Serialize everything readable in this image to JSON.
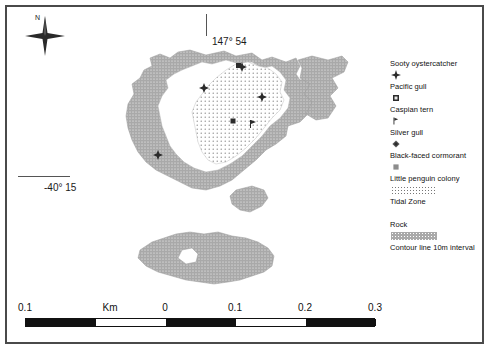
{
  "map": {
    "title": "",
    "coordinates": {
      "longitude_label": "147° 54",
      "latitude_label": "-40° 15"
    },
    "north_arrow": {
      "label": "N",
      "icon": "compass-north-star-icon"
    },
    "colors": {
      "rock_fill": "#a9a9a9",
      "tidal_fill": "#ffffff",
      "penguin_dot": "#777777",
      "marker": "#2b2b2b",
      "frame": "#4a4a4a",
      "text": "#111111"
    }
  },
  "legend": {
    "items": [
      {
        "label": "Sooty oystercatcher",
        "symbol": "cross-star-marker-icon"
      },
      {
        "label": "Pacific gull",
        "symbol": "filled-square-marker-icon"
      },
      {
        "label": "Caspian tern",
        "symbol": "flag-marker-icon"
      },
      {
        "label": "Silver gull",
        "symbol": "diamond-marker-icon"
      },
      {
        "label": "Black-faced cormorant",
        "symbol": "gray-square-marker-icon"
      },
      {
        "label": "Little penguin colony",
        "symbol": "dotted-area-swatch"
      },
      {
        "label": "Tidal Zone",
        "symbol": "white-area-swatch"
      },
      {
        "label": "Rock",
        "symbol": "gray-stipple-area-swatch"
      },
      {
        "label": "Contour line 10m interval",
        "symbol": "contour-line-swatch"
      }
    ]
  },
  "scalebar": {
    "unit": "Km",
    "unit_x": 85,
    "ticks": [
      {
        "label": "0.1",
        "x": 0
      },
      {
        "label": "0",
        "x": 140
      },
      {
        "label": "0.1",
        "x": 210
      },
      {
        "label": "0.2",
        "x": 280
      },
      {
        "label": "0.3",
        "x": 350
      }
    ],
    "segments": [
      {
        "x": 0,
        "w": 70
      },
      {
        "x": 140,
        "w": 70
      },
      {
        "x": 280,
        "w": 70
      }
    ]
  },
  "features": {
    "rock_outer_main": "M 206,55 L 224,51 L 236,56 L 252,53 L 262,60 L 272,57 L 286,62 L 296,58 L 300,66 L 296,74 L 300,80 L 310,78 L 318,84 L 316,94 L 322,100 L 318,110 L 308,114 L 300,122 L 288,126 L 286,136 L 276,144 L 266,150 L 256,160 L 244,170 L 232,180 L 220,186 L 206,190 L 192,188 L 180,182 L 168,176 L 156,170 L 146,162 L 138,152 L 132,140 L 128,128 L 126,116 L 128,104 L 134,94 L 132,84 L 140,78 L 144,70 L 152,66 L 150,58 L 160,54 L 170,58 L 178,52 L 190,50 Z",
    "tidal_inner_main": "M 212,64 L 226,60 L 240,64 L 252,62 L 262,68 L 272,66 L 280,72 L 286,80 L 284,90 L 290,98 L 288,108 L 280,118 L 270,126 L 262,136 L 252,146 L 242,156 L 230,164 L 218,170 L 206,172 L 194,168 L 184,162 L 176,154 L 170,146 L 166,136 L 162,126 L 160,116 L 158,106 L 162,96 L 168,88 L 166,80 L 174,74 L 182,70 L 192,66 L 202,62 Z",
    "penguin_colony": "M 236,64 L 248,62 L 258,66 L 268,68 L 276,74 L 282,82 L 280,92 L 284,100 L 280,110 L 272,118 L 264,128 L 256,138 L 246,148 L 236,156 L 226,162 L 216,164 L 208,160 L 202,152 L 198,142 L 196,132 L 194,122 L 192,112 L 196,102 L 202,94 L 208,86 L 216,78 L 226,70 Z",
    "rock_lobe_east": "M 300,62 L 312,58 L 326,62 L 338,58 L 344,64 L 340,74 L 330,80 L 334,88 L 328,96 L 332,106 L 326,116 L 316,118 L 308,112 L 312,102 L 306,94 L 310,84 L 302,78 L 304,70 Z",
    "rock_small_island": "M 236,190 L 252,186 L 264,190 L 268,198 L 262,206 L 250,212 L 240,210 L 232,204 L 230,196 Z",
    "rock_south_island": "M 140,250 L 152,242 L 164,238 L 176,234 L 190,232 L 204,234 L 218,232 L 232,236 L 246,238 L 258,242 L 268,248 L 274,256 L 272,266 L 264,272 L 252,276 L 240,280 L 228,282 L 214,284 L 200,282 L 186,280 L 172,276 L 158,272 L 146,266 L 138,258 Z",
    "lagoon_hole": "M 182,250 L 192,248 L 198,254 L 196,262 L 186,264 L 178,258 Z",
    "markers": [
      {
        "type": "cross-star-marker-icon",
        "species": "Sooty oystercatcher",
        "x": 242,
        "y": 67
      },
      {
        "type": "cross-star-marker-icon",
        "species": "Sooty oystercatcher",
        "x": 204,
        "y": 88
      },
      {
        "type": "cross-star-marker-icon",
        "species": "Sooty oystercatcher",
        "x": 262,
        "y": 97
      },
      {
        "type": "cross-star-marker-icon",
        "species": "Sooty oystercatcher",
        "x": 158,
        "y": 155
      },
      {
        "type": "filled-square-marker-icon",
        "species": "Pacific gull",
        "x": 239,
        "y": 66
      },
      {
        "type": "filled-square-marker-icon",
        "species": "Pacific gull",
        "x": 233,
        "y": 121
      },
      {
        "type": "flag-marker-icon",
        "species": "Caspian tern",
        "x": 252,
        "y": 124
      }
    ]
  }
}
